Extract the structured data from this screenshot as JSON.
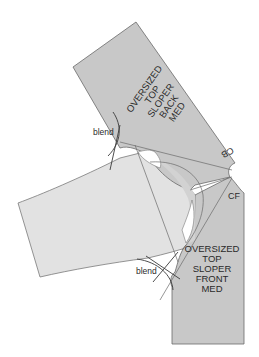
{
  "diagram": {
    "colors": {
      "background": "#ffffff",
      "bodice_fill": "#c8c8c8",
      "sleeve_fill": "#e0e0e0",
      "outline": "#6a6a6a",
      "text": "#2a2a2a"
    },
    "back_piece": {
      "label_lines": [
        "OVERSIZED",
        "TOP",
        "SLOPER",
        "BACK",
        "MED"
      ],
      "cb_label": "CB"
    },
    "front_piece": {
      "label_lines": [
        "OVERSIZED",
        "TOP",
        "SLOPER",
        "FRONT",
        "MED"
      ],
      "cf_label": "CF"
    },
    "annotations": {
      "blend_top": "blend",
      "blend_bottom": "blend"
    }
  }
}
